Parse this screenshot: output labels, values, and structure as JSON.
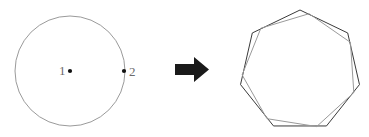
{
  "figure": {
    "background_color": "#ffffff",
    "width": 369,
    "height": 137,
    "left_shape": {
      "name": "circle",
      "stroke_color": "#8f8f8f",
      "stroke_width": 0.9,
      "fill": "none",
      "center_x": 70,
      "center_y": 71,
      "radius": 55,
      "points": [
        {
          "label": "1",
          "role": "center-point",
          "dot_x": 70,
          "dot_y": 71,
          "dot_radius": 2.1,
          "dot_color": "#111111",
          "label_x": 59,
          "label_y": 75
        },
        {
          "label": "2",
          "role": "boundary-point",
          "dot_x": 124,
          "dot_y": 71,
          "dot_radius": 2.1,
          "dot_color": "#111111",
          "label_x": 129,
          "label_y": 76
        }
      ]
    },
    "arrow": {
      "name": "right-arrow",
      "color": "#1a1a1a",
      "shaft_x": 175,
      "shaft_y": 64,
      "shaft_width": 21,
      "shaft_height": 11,
      "head_points": "194,57 209,69.5 194,82",
      "points": "175,64 194,64 194,57 209,69.5 194,82 194,75 175,75"
    },
    "right_shape": {
      "name": "overlapping-heptagons",
      "sides": 7,
      "center_x": 300,
      "center_y": 71,
      "polygons": [
        {
          "name": "outer-heptagon",
          "stroke_color": "#3a3a3a",
          "stroke_width": 1.0,
          "fill": "none",
          "radius": 61,
          "rotation_deg": 0,
          "points": "300,10 347.7,37.5 336.1,91.8 263.9,91.8 252.3,37.5"
        },
        {
          "name": "inner-heptagon",
          "stroke_color": "#9a9a9a",
          "stroke_width": 1.0,
          "fill": "none",
          "radius": 58,
          "rotation_deg": 9
        }
      ]
    }
  }
}
